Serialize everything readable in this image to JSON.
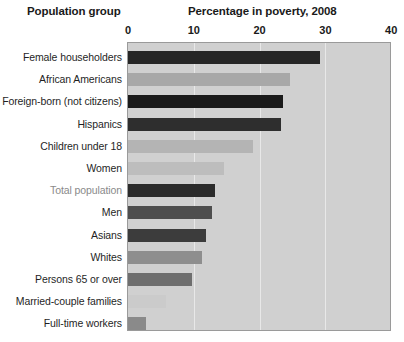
{
  "header": {
    "group_label": "Population group",
    "chart_title": "Percentage in poverty, 2008"
  },
  "chart_data": {
    "type": "bar",
    "orientation": "horizontal",
    "title": "Percentage in poverty, 2008",
    "xlabel": "",
    "ylabel": "Population group",
    "xlim": [
      0,
      40
    ],
    "ticks": [
      0,
      10,
      20,
      30,
      40
    ],
    "tick_labels": [
      "0",
      "10",
      "20",
      "30",
      "40"
    ],
    "grid": true,
    "legend": "none",
    "categories": [
      "Female householders",
      "African Americans",
      "Foreign-born (not citizens)",
      "Hispanics",
      "Children under 18",
      "Women",
      "Total population",
      "Men",
      "Asians",
      "Whites",
      "Persons 65 or over",
      "Married-couple families",
      "Full-time workers"
    ],
    "values": [
      29.2,
      24.6,
      23.6,
      23.2,
      19.0,
      14.6,
      13.2,
      12.7,
      11.8,
      11.2,
      9.7,
      5.8,
      2.8
    ],
    "bar_colors": [
      "#262626",
      "#a8a8a8",
      "#1a1a1a",
      "#2e2e2e",
      "#b4b4b4",
      "#bdbdbd",
      "#2b2b2b",
      "#4e4e4e",
      "#3c3c3c",
      "#8e8e8e",
      "#6e6e6e",
      "#cbcbcb",
      "#8a8a8a"
    ],
    "muted_category": "Total population",
    "plot_background": "#d0d0d0",
    "gridline_color": "#e8e8e8",
    "plot_border_color": "#9a9a9a",
    "page_background": "#ffffff"
  }
}
